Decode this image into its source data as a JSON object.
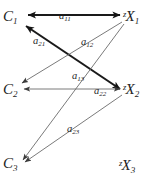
{
  "diagram": {
    "background_color": "#ffffff",
    "line_color_thin": "#6b6b6b",
    "line_color_thick": "#1a1a1a",
    "nodes": [
      {
        "id": "C1",
        "prefix": "",
        "base": "C",
        "sub": "1",
        "side": "left",
        "x": 14,
        "y": 18
      },
      {
        "id": "C2",
        "prefix": "",
        "base": "C",
        "sub": "2",
        "side": "left",
        "x": 14,
        "y": 91
      },
      {
        "id": "C3",
        "prefix": "",
        "base": "C",
        "sub": "3",
        "side": "left",
        "x": 14,
        "y": 165
      },
      {
        "id": "X1",
        "prefix": "z",
        "base": "X",
        "sub": "1",
        "side": "right",
        "x": 131,
        "y": 18
      },
      {
        "id": "X2",
        "prefix": "z",
        "base": "X",
        "sub": "2",
        "side": "right",
        "x": 131,
        "y": 91
      },
      {
        "id": "X3",
        "prefix": "z",
        "base": "X",
        "sub": "3",
        "side": "right",
        "x": 128,
        "y": 167
      }
    ],
    "edges": [
      {
        "id": "a11",
        "base": "a",
        "sub": "11",
        "from": "zX1",
        "to": "C1",
        "style": "thick",
        "arrows": "both"
      },
      {
        "id": "a21",
        "base": "a",
        "sub": "21",
        "from": "C1",
        "to": "zX2",
        "style": "thick",
        "arrows": "both"
      },
      {
        "id": "a12",
        "base": "a",
        "sub": "12",
        "from": "zX1",
        "to": "C2",
        "style": "thin",
        "arrows": "end"
      },
      {
        "id": "a13",
        "base": "a",
        "sub": "13",
        "from": "zX1",
        "to": "C3",
        "style": "thin",
        "arrows": "end"
      },
      {
        "id": "a22",
        "base": "a",
        "sub": "22",
        "from": "zX2",
        "to": "C2",
        "style": "thin",
        "arrows": "both"
      },
      {
        "id": "a23",
        "base": "a",
        "sub": "23",
        "from": "zX2",
        "to": "C3",
        "style": "thin",
        "arrows": "end"
      }
    ]
  }
}
